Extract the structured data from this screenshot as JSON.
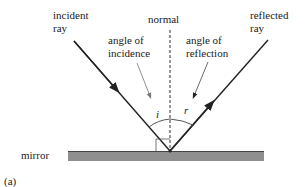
{
  "labels": {
    "incident_ray": [
      "incident",
      "ray"
    ],
    "normal": "normal",
    "angle_of_incidence": [
      "angle of",
      "incidence"
    ],
    "angle_of_reflection": [
      "angle of",
      "reflection"
    ],
    "reflected_ray": [
      "reflected",
      "ray"
    ],
    "i": "i",
    "r": "r",
    "mirror": "mirror",
    "panel": "(a)"
  },
  "colors": {
    "ray": "#222222",
    "mirror": "#8a8a8a",
    "pointer": "#777777"
  }
}
